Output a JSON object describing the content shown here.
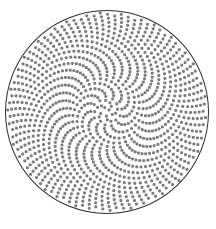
{
  "figure": {
    "title": "Phyllotaxis spiral dot pattern",
    "background_color": "#ffffff"
  },
  "chart_data": {
    "type": "scatter",
    "title": "Phyllotaxis spiral dot pattern",
    "subtitle": "",
    "xlabel": "",
    "ylabel": "",
    "grid": false,
    "legend": null,
    "axis_visible": false,
    "tick_labels": [],
    "annotations": [],
    "xlim": [
      -1.05,
      1.05
    ],
    "ylim": [
      -1.05,
      1.05
    ],
    "generator": {
      "model": "vogel-fermat-phyllotaxis",
      "point_count": 1180,
      "divergence_angle_deg": 137.507764,
      "radius_exponent": 0.5,
      "angle_offset_deg": 0,
      "spiral_twist_coefficient_deg": -46,
      "direction": "counterclockwise",
      "visible_parastichy_arms": 5,
      "secondary_parastichy_arms": 13
    },
    "dot_style": {
      "fill": "#7d7d7d",
      "radius_px": 1.55,
      "edge": "none",
      "opacity": 1
    },
    "boundary": {
      "shape": "circle",
      "center_px": [
        107,
        112
      ],
      "radius_px": 101.5,
      "stroke": "#2e2e2e",
      "stroke_width_px": 1,
      "fill": "none"
    }
  }
}
